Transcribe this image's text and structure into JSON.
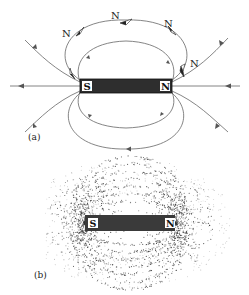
{
  "figure": {
    "panel_a": {
      "label": "(a)",
      "magnet": {
        "south_label": "S",
        "north_label": "N"
      },
      "compass_labels": [
        "N",
        "N",
        "N",
        "N"
      ]
    },
    "panel_b": {
      "label": "(b)",
      "magnet": {
        "south_label": "S",
        "north_label": "N"
      }
    }
  },
  "colors": {
    "line": "#555555",
    "magnet_fill": "#2e2e2e",
    "text": "#222222",
    "filings": "#333333"
  }
}
